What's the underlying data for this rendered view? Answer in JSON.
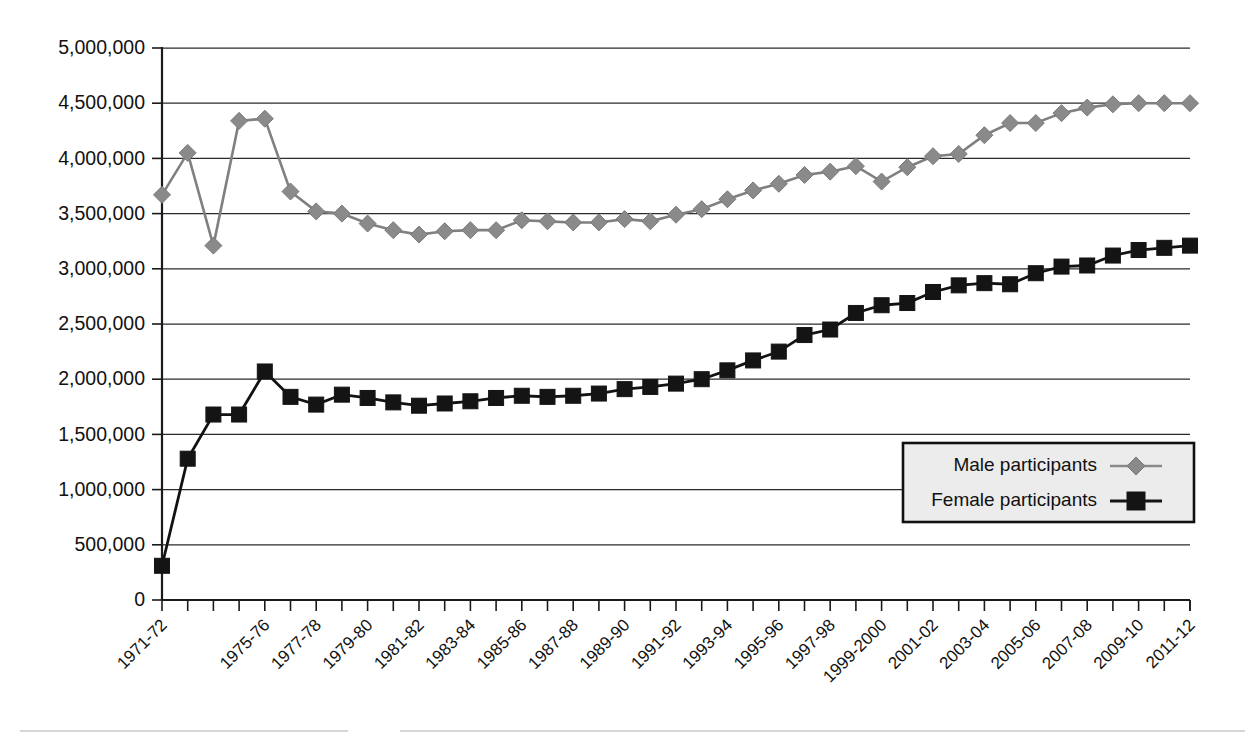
{
  "chart_data": {
    "type": "line",
    "title": "",
    "subtitle": "",
    "xlabel": "",
    "ylabel": "",
    "ylim": [
      0,
      5000000
    ],
    "ytick_step": 500000,
    "grid": true,
    "legend_position": "inside-bottom-right",
    "ytick_labels": [
      "0",
      "500,000",
      "1,000,000",
      "1,500,000",
      "2,000,000",
      "2,500,000",
      "3,000,000",
      "3,500,000",
      "4,000,000",
      "4,500,000",
      "5,000,000"
    ],
    "ytick_values": [
      0,
      500000,
      1000000,
      1500000,
      2000000,
      2500000,
      3000000,
      3500000,
      4000000,
      4500000,
      5000000
    ],
    "categories": [
      "1971-72",
      "1972-73",
      "1973-74",
      "1974-75",
      "1975-76",
      "1976-77",
      "1977-78",
      "1978-79",
      "1979-80",
      "1980-81",
      "1981-82",
      "1982-83",
      "1983-84",
      "1984-85",
      "1985-86",
      "1986-87",
      "1987-88",
      "1988-89",
      "1989-90",
      "1990-91",
      "1991-92",
      "1992-93",
      "1993-94",
      "1994-95",
      "1995-96",
      "1996-97",
      "1997-98",
      "1998-99",
      "1999-2000",
      "2000-01",
      "2001-02",
      "2002-03",
      "2003-04",
      "2004-05",
      "2005-06",
      "2006-07",
      "2007-08",
      "2008-09",
      "2009-10",
      "2010-11",
      "2011-12"
    ],
    "xtick_labels_shown": [
      "1971-72",
      "1975-76",
      "1977-78",
      "1979-80",
      "1981-82",
      "1983-84",
      "1985-86",
      "1987-88",
      "1989-90",
      "1991-92",
      "1993-94",
      "1995-96",
      "1997-98",
      "1999-2000",
      "2001-02",
      "2003-04",
      "2005-06",
      "2007-08",
      "2009-10",
      "2011-12"
    ],
    "xtick_label_indices": [
      0,
      4,
      6,
      8,
      10,
      12,
      14,
      16,
      18,
      20,
      22,
      24,
      26,
      28,
      30,
      32,
      34,
      36,
      38,
      40
    ],
    "series": [
      {
        "name": "Male participants",
        "color": "#8a8a8a",
        "marker": "diamond",
        "values": [
          3670000,
          4050000,
          3210000,
          4340000,
          4360000,
          3700000,
          3520000,
          3500000,
          3410000,
          3350000,
          3310000,
          3340000,
          3350000,
          3350000,
          3440000,
          3430000,
          3420000,
          3420000,
          3450000,
          3430000,
          3490000,
          3540000,
          3630000,
          3710000,
          3770000,
          3850000,
          3880000,
          3930000,
          3790000,
          3920000,
          4020000,
          4040000,
          4210000,
          4320000,
          4320000,
          4410000,
          4460000,
          4490000,
          4500000,
          4500000,
          4500000
        ]
      },
      {
        "name": "Female participants",
        "color": "#141414",
        "marker": "square",
        "values": [
          310000,
          1280000,
          1680000,
          1680000,
          2070000,
          1840000,
          1770000,
          1860000,
          1830000,
          1790000,
          1760000,
          1780000,
          1800000,
          1830000,
          1850000,
          1840000,
          1850000,
          1870000,
          1910000,
          1930000,
          1960000,
          2000000,
          2080000,
          2170000,
          2250000,
          2400000,
          2450000,
          2600000,
          2670000,
          2690000,
          2790000,
          2850000,
          2870000,
          2860000,
          2960000,
          3020000,
          3030000,
          3120000,
          3170000,
          3190000,
          3210000
        ]
      }
    ],
    "legend": [
      {
        "label": "Male participants",
        "marker": "diamond",
        "color": "#8a8a8a"
      },
      {
        "label": "Female participants",
        "marker": "square",
        "color": "#141414"
      }
    ]
  },
  "colors": {
    "male": "#8a8a8a",
    "female": "#141414",
    "grid": "#2b2b2b",
    "axis": "#1a1a1a",
    "legend_bg": "#ececec",
    "page_bg": "#ffffff"
  }
}
